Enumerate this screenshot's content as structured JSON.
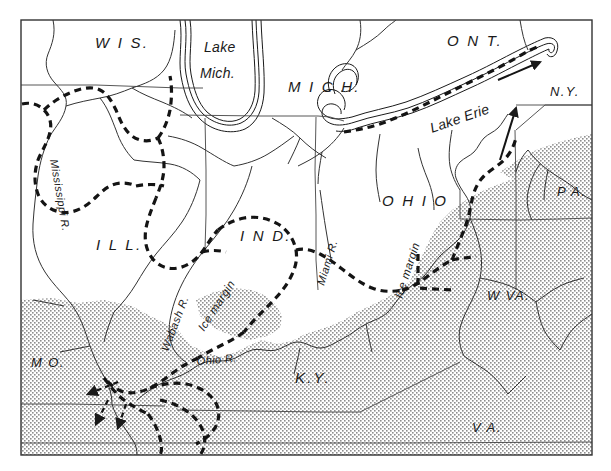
{
  "figure": {
    "type": "historical-geologic-map",
    "background_color": "#ffffff",
    "ink_color": "#1a1a1a",
    "stipple_color": "#9a9a9a"
  },
  "frame": {
    "x": 21,
    "y": 20,
    "width": 571,
    "height": 435
  },
  "labels": {
    "states": [
      {
        "id": "wis",
        "text": "W I S.",
        "x": 95,
        "y": 48
      },
      {
        "id": "mich",
        "text": "M I C H.",
        "x": 288,
        "y": 92
      },
      {
        "id": "ont",
        "text": "O N T.",
        "x": 447,
        "y": 46
      },
      {
        "id": "ny",
        "text": "N.Y.",
        "x": 550,
        "y": 96
      },
      {
        "id": "pa",
        "text": "P A.",
        "x": 561,
        "y": 196
      },
      {
        "id": "ohio",
        "text": "O H I O",
        "x": 384,
        "y": 206
      },
      {
        "id": "ind",
        "text": "I N D.",
        "x": 240,
        "y": 241
      },
      {
        "id": "ill",
        "text": "I L L.",
        "x": 96,
        "y": 250
      },
      {
        "id": "mo",
        "text": "M O.",
        "x": 31,
        "y": 367
      },
      {
        "id": "ky",
        "text": "K.Y.",
        "x": 298,
        "y": 383
      },
      {
        "id": "wva",
        "text": "W VA.",
        "x": 489,
        "y": 300
      },
      {
        "id": "va",
        "text": "V A.",
        "x": 474,
        "y": 432
      }
    ],
    "water": [
      {
        "id": "lake-michigan",
        "line1": "Lake",
        "line2": "Mich.",
        "x": 204,
        "y": 47
      },
      {
        "id": "lake-erie",
        "text": "Lake Erie",
        "x": 438,
        "y": 127,
        "rotate": -19
      }
    ],
    "rivers": [
      {
        "id": "mississippi-river",
        "text": "Mississippi  R.",
        "x": 46,
        "y": 160,
        "rotate": 80
      },
      {
        "id": "wabash-river",
        "text": "Wabash  R.",
        "x": 169,
        "y": 350,
        "rotate": -69
      },
      {
        "id": "ohio-river",
        "text": "Ohio  R.",
        "x": 200,
        "y": 363,
        "rotate": -4
      },
      {
        "id": "miami-river",
        "text": "Miami  R.",
        "x": 325,
        "y": 285,
        "rotate": -73
      }
    ],
    "features": [
      {
        "id": "ice-margin-indiana",
        "text": "Ice  margin",
        "x": 206,
        "y": 330,
        "rotate": -57
      },
      {
        "id": "ice-margin-ohio",
        "text": "Ice  margin",
        "x": 404,
        "y": 297,
        "rotate": -72
      }
    ]
  },
  "ice_margin": {
    "style": "heavy dashed line",
    "description": "Dashed line marking the southern limit of the glacial ice sheet, running from the upper Mississippi through Illinois, Indiana, Ohio into Pennsylvania and along Lake Erie"
  },
  "drift_area": {
    "style": "stipple shading",
    "description": "Stippled (dotted) shading covering the unglaciated uplands of Missouri, Kentucky, West Virginia, Virginia and western Pennsylvania"
  },
  "flow_arrows": {
    "count": 5,
    "description": "Arrowheads showing meltwater drainage directions: three in southeastern Missouri, one east along Lake Erie, one north-northeast in eastern Ohio"
  }
}
